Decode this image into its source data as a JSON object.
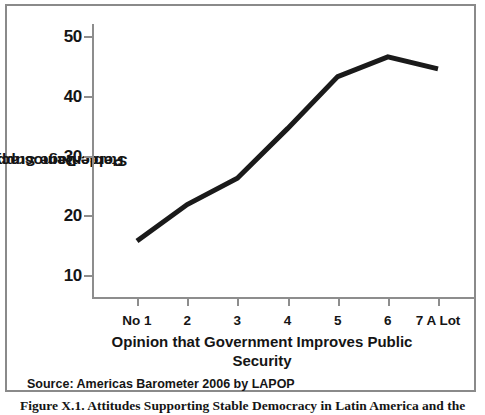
{
  "chart_data": {
    "type": "line",
    "title": "",
    "xlabel": "Opinion that Government Improves Public Security",
    "ylabel": "Percentage Support toward Stable Democracy",
    "categories": [
      "No 1",
      "2",
      "3",
      "4",
      "5",
      "6",
      "7 A Lot"
    ],
    "series": [
      {
        "name": "Percentage Support toward Stable Democracy",
        "values": [
          15.7,
          21.8,
          26.2,
          34.5,
          43.2,
          46.5,
          44.5
        ],
        "color": "#1a1a1a"
      }
    ],
    "ylim": [
      6,
      52
    ],
    "yticks": [
      10,
      20,
      30,
      40,
      50
    ],
    "ytick_labels": [
      "10",
      "20",
      "30",
      "40",
      "50"
    ],
    "grid": false,
    "legend": false,
    "legend_position": "none",
    "line_width": 5
  },
  "figure": {
    "source_note": "Source: Americas Barometer 2006 by LAPOP",
    "caption": "Figure X.1. Attitudes Supporting Stable Democracy in Latin America and the",
    "xlabel_line1": "Opinion that Government Improves Public",
    "xlabel_line2": "Security",
    "ylabel_line1": "Percentage Support toward",
    "ylabel_line2": "Stable Democracy"
  },
  "colors": {
    "line": "#1a1a1a",
    "axis": "#8d8d8d",
    "frame": "#8a8a8a",
    "background": "#ffffff",
    "text": "#151515"
  }
}
